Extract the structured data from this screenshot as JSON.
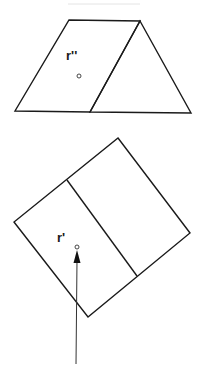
{
  "diagram": {
    "top_figure": {
      "description": "Prism-like shape: parallelogram face joined to a triangle",
      "label": "r''",
      "stroke_color": "#1a1a1a"
    },
    "bottom_figure": {
      "description": "Rotated rectangle divided into two panels, with an arrow pointing up to a point",
      "label": "r'",
      "stroke_color": "#1a1a1a",
      "arrow_color": "#333333"
    },
    "background": "#ffffff"
  }
}
